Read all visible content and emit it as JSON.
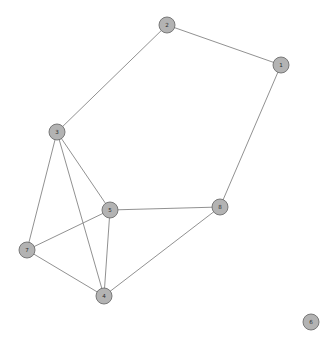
{
  "figure": {
    "title": "",
    "background_color": "#ffffff",
    "width": 328,
    "height": 344
  },
  "style": {
    "node_fill": "#b3b3b3",
    "node_stroke": "#6e6e6e",
    "node_radius": 8,
    "edge_color": "#848484",
    "edge_width": 0.9,
    "label_color": "#2b2b2b",
    "label_font_size": 5.6
  },
  "chart_data": {
    "type": "network",
    "title": "",
    "xlabel": "",
    "ylabel": "",
    "directed": false,
    "weighted": false,
    "node_count": 8,
    "edge_count": 11,
    "nodes": [
      {
        "id": "1",
        "label": "1",
        "x": 281,
        "y": 65,
        "degree": 2
      },
      {
        "id": "2",
        "label": "2",
        "x": 167,
        "y": 25,
        "degree": 2
      },
      {
        "id": "3",
        "label": "3",
        "x": 57,
        "y": 132,
        "degree": 4
      },
      {
        "id": "4",
        "label": "4",
        "x": 104,
        "y": 296,
        "degree": 4
      },
      {
        "id": "5",
        "label": "5",
        "x": 110,
        "y": 210,
        "degree": 4
      },
      {
        "id": "6",
        "label": "6",
        "x": 311,
        "y": 322,
        "degree": 0
      },
      {
        "id": "7",
        "label": "7",
        "x": 27,
        "y": 250,
        "degree": 3
      },
      {
        "id": "8",
        "label": "8",
        "x": 220,
        "y": 207,
        "degree": 3
      }
    ],
    "edges": [
      {
        "source": "2",
        "target": "1"
      },
      {
        "source": "2",
        "target": "3"
      },
      {
        "source": "1",
        "target": "8"
      },
      {
        "source": "3",
        "target": "5"
      },
      {
        "source": "3",
        "target": "7"
      },
      {
        "source": "3",
        "target": "4"
      },
      {
        "source": "5",
        "target": "8"
      },
      {
        "source": "5",
        "target": "7"
      },
      {
        "source": "5",
        "target": "4"
      },
      {
        "source": "7",
        "target": "4"
      },
      {
        "source": "4",
        "target": "8"
      }
    ],
    "isolated_nodes": [
      "6"
    ]
  }
}
